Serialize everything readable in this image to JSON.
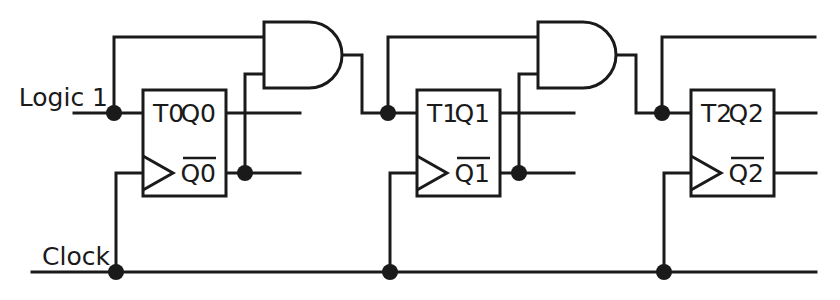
{
  "diagram": {
    "type": "logic-circuit-schematic",
    "background_color": "#ffffff",
    "line_color": "#1a1a1a",
    "line_width": 3,
    "junction_radius": 8,
    "canvas": {
      "width": 840,
      "height": 300
    }
  },
  "labels": {
    "logic1": "Logic 1",
    "clock": "Clock"
  },
  "flipflops": [
    {
      "id": "ff0",
      "t_label": "T0",
      "q_label": "Q0",
      "qbar_label": "Q0",
      "qbar_overline": true,
      "box": {
        "x": 143,
        "y": 90,
        "w": 83,
        "h": 106
      },
      "t_input_y": 113,
      "clock_input_y": 173,
      "q_output_y": 113,
      "qbar_output_y": 173
    },
    {
      "id": "ff1",
      "t_label": "T1",
      "q_label": "Q1",
      "qbar_label": "Q1",
      "qbar_overline": true,
      "box": {
        "x": 417,
        "y": 90,
        "w": 83,
        "h": 106
      },
      "t_input_y": 113,
      "clock_input_y": 173,
      "q_output_y": 113,
      "qbar_output_y": 173
    },
    {
      "id": "ff2",
      "t_label": "T2",
      "q_label": "Q2",
      "qbar_label": "Q2",
      "qbar_overline": true,
      "box": {
        "x": 691,
        "y": 90,
        "w": 83,
        "h": 106
      },
      "t_input_y": 113,
      "clock_input_y": 173,
      "q_output_y": 113,
      "qbar_output_y": 173
    }
  ],
  "gates": [
    {
      "id": "and0",
      "kind": "AND",
      "shape": "d-shape",
      "x": 264,
      "y": 22,
      "w": 78,
      "h": 66,
      "input_top_y": 37,
      "input_bottom_y": 74,
      "output_y": 55
    },
    {
      "id": "and1",
      "kind": "AND",
      "shape": "d-shape",
      "x": 538,
      "y": 22,
      "w": 78,
      "h": 66,
      "input_top_y": 37,
      "input_bottom_y": 74,
      "output_y": 55
    }
  ],
  "rails": {
    "logic1_y": 113,
    "logic1_x_start": 74,
    "clock_y": 272,
    "clock_x_start": 32,
    "clock_x_end": 816,
    "top_bus_y": 37
  },
  "junctions": [
    {
      "name": "logic1-tap-ff0",
      "x": 114,
      "y": 113
    },
    {
      "name": "qbar0-tap",
      "x": 245,
      "y": 173
    },
    {
      "name": "and0-out-to-t1",
      "x": 388,
      "y": 113
    },
    {
      "name": "qbar1-tap",
      "x": 519,
      "y": 173
    },
    {
      "name": "and1-out-to-t2",
      "x": 662,
      "y": 113
    },
    {
      "name": "clock-tap-ff0",
      "x": 116,
      "y": 272
    },
    {
      "name": "clock-tap-ff1",
      "x": 390,
      "y": 272
    },
    {
      "name": "clock-tap-ff2",
      "x": 664,
      "y": 272
    }
  ],
  "wires": [
    {
      "name": "logic1-rail",
      "points": "74,113 143,113"
    },
    {
      "name": "logic1-branch-up",
      "points": "114,113 114,37 264,37"
    },
    {
      "name": "q0-output",
      "points": "226,113 300,113"
    },
    {
      "name": "qbar0-output",
      "points": "226,173 300,173"
    },
    {
      "name": "qbar0-to-and0",
      "points": "245,173 245,74 264,74"
    },
    {
      "name": "and0-output-to-t1",
      "points": "342,55 362,55 362,113 417,113"
    },
    {
      "name": "t1-branch-up",
      "points": "388,113 388,37 538,37"
    },
    {
      "name": "clock-branch-ff0",
      "points": "116,272 116,173 143,173"
    },
    {
      "name": "clock-branch-ff1",
      "points": "390,272 390,173 417,173"
    },
    {
      "name": "clock-branch-ff2",
      "points": "664,272 664,173 691,173"
    },
    {
      "name": "q1-output",
      "points": "500,113 574,113"
    },
    {
      "name": "qbar1-output",
      "points": "500,173 574,173"
    },
    {
      "name": "qbar1-to-and1",
      "points": "519,173 519,74 538,74"
    },
    {
      "name": "and1-output-to-t2",
      "points": "616,55 636,55 636,113 691,113"
    },
    {
      "name": "t2-branch-up",
      "points": "662,113 662,37 815,37"
    },
    {
      "name": "q2-output",
      "points": "774,113 816,113"
    },
    {
      "name": "qbar2-output",
      "points": "774,173 816,173"
    },
    {
      "name": "clock-rail",
      "points": "32,272 816,272"
    }
  ]
}
